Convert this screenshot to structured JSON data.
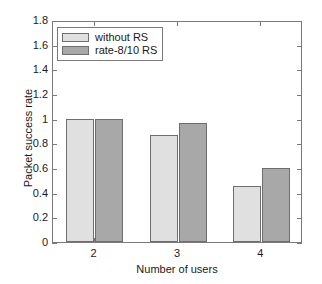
{
  "chart_data": {
    "type": "bar",
    "title": "",
    "subtitle": "",
    "xlabel": "Number of users",
    "ylabel": "Packet success rate",
    "categories": [
      "2",
      "3",
      "4"
    ],
    "series": [
      {
        "name": "without RS",
        "values": [
          1.0,
          0.87,
          0.455
        ],
        "color": "#e0e0e0"
      },
      {
        "name": "rate-8/10 RS",
        "values": [
          1.0,
          0.965,
          0.6
        ],
        "color": "#a8a8a8"
      }
    ],
    "ylim": [
      0,
      1.8
    ],
    "yticks": [
      "0",
      "0.2",
      "0.4",
      "0.6",
      "0.8",
      "1",
      "1.2",
      "1.4",
      "1.6",
      "1.8"
    ],
    "ytick_values": [
      0,
      0.2,
      0.4,
      0.6,
      0.8,
      1.0,
      1.2,
      1.4,
      1.6,
      1.8
    ],
    "xticks": [
      "2",
      "3",
      "4"
    ],
    "grid": false,
    "legend_position": "top-left",
    "axis_color": "#7a7a7a",
    "bar_edge_color": "#6e6e6e",
    "background": "#ffffff"
  },
  "legend": {
    "entries": [
      {
        "label": "without RS",
        "color": "#e0e0e0"
      },
      {
        "label": "rate-8/10 RS",
        "color": "#a8a8a8"
      }
    ]
  }
}
